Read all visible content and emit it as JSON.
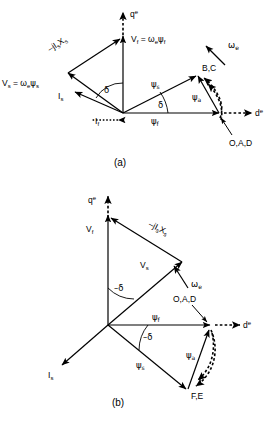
{
  "figure": {
    "type": "phasor-vector-diagram",
    "background_color": "#ffffff",
    "line_color": "#000000",
    "panels": [
      {
        "id": "a",
        "caption": "(a)",
        "description": "Phasor diagram for motoring operation with positive load angle delta",
        "axes": [
          {
            "name": "q-axis",
            "label": "q",
            "superscript": "e",
            "style": "dashed-arrow",
            "direction": "up"
          },
          {
            "name": "d-axis",
            "label": "d",
            "superscript": "e",
            "style": "dashed-arrow",
            "direction": "right"
          }
        ],
        "vectors": [
          {
            "name": "stator-voltage",
            "label": "V",
            "subscript": "s",
            "expression": "Vₛ = ωₑψₛ"
          },
          {
            "name": "field-voltage",
            "label": "V",
            "subscript": "f",
            "expression": "V_f = ωₑψ_f"
          },
          {
            "name": "reactance-drop",
            "label": "-jIₛXₛ"
          },
          {
            "name": "stator-current",
            "label": "I",
            "subscript": "s"
          },
          {
            "name": "field-current",
            "label": "I",
            "subscript": "f"
          },
          {
            "name": "stator-flux",
            "label": "ψ",
            "subscript": "s"
          },
          {
            "name": "field-flux",
            "label": "ψ",
            "subscript": "f"
          },
          {
            "name": "armature-flux",
            "label": "ψ",
            "subscript": "a"
          },
          {
            "name": "sync-speed",
            "label": "ω",
            "subscript": "e"
          }
        ],
        "angles": [
          {
            "name": "delta-upper",
            "label": "δ"
          },
          {
            "name": "delta-lower",
            "label": "δ"
          }
        ],
        "point_labels": [
          {
            "name": "point-bc",
            "label": "B,C"
          },
          {
            "name": "point-oad",
            "label": "O,A,D"
          }
        ]
      },
      {
        "id": "b",
        "caption": "(b)",
        "description": "Phasor diagram for generating operation with negative load angle delta",
        "axes": [
          {
            "name": "q-axis",
            "label": "q",
            "superscript": "e",
            "style": "dashed-arrow",
            "direction": "up"
          },
          {
            "name": "d-axis",
            "label": "d",
            "superscript": "e",
            "style": "dashed-arrow",
            "direction": "right"
          }
        ],
        "vectors": [
          {
            "name": "stator-voltage",
            "label": "V",
            "subscript": "s"
          },
          {
            "name": "field-voltage",
            "label": "V",
            "subscript": "f"
          },
          {
            "name": "reactance-drop",
            "label": "-jIₛXₛ"
          },
          {
            "name": "stator-current",
            "label": "I",
            "subscript": "s"
          },
          {
            "name": "stator-flux",
            "label": "ψ",
            "subscript": "s"
          },
          {
            "name": "field-flux",
            "label": "ψ",
            "subscript": "f"
          },
          {
            "name": "armature-flux",
            "label": "ψ",
            "subscript": "a"
          },
          {
            "name": "sync-speed",
            "label": "ω",
            "subscript": "e"
          }
        ],
        "angles": [
          {
            "name": "neg-delta-upper",
            "label": "−δ"
          },
          {
            "name": "neg-delta-lower",
            "label": "−δ"
          }
        ],
        "point_labels": [
          {
            "name": "point-oad",
            "label": "O,A,D"
          },
          {
            "name": "point-fe",
            "label": "F,E"
          }
        ]
      }
    ]
  },
  "labels": {
    "panel_a": {
      "q_axis": "q",
      "q_axis_sup": "e",
      "d_axis": "d",
      "d_axis_sup": "e",
      "vf_eq": "V",
      "vf_sub": "f",
      "vf_rest": " = ω",
      "vf_rest_sub": "e",
      "vf_psi": "ψ",
      "vf_psi_sub": "f",
      "vs_eq": "V",
      "vs_sub": "s",
      "vs_rest": " = ω",
      "vs_rest_sub": "e",
      "vs_psi": "ψ",
      "vs_psi_sub": "s",
      "jisxs": "–jI",
      "jisxs_sub1": "s",
      "jisxs_x": "X",
      "jisxs_sub2": "s",
      "is": "I",
      "is_sub": "s",
      "if": "I",
      "if_sub": "f",
      "psi_s": "ψ",
      "psi_s_sub": "s",
      "psi_f": "ψ",
      "psi_f_sub": "f",
      "psi_a": "ψ",
      "psi_a_sub": "a",
      "omega_e": "ω",
      "omega_e_sub": "e",
      "delta_1": "δ",
      "delta_2": "δ",
      "bc": "B,C",
      "oad": "O,A,D",
      "caption": "(a)"
    },
    "panel_b": {
      "q_axis": "q",
      "q_axis_sup": "e",
      "d_axis": "d",
      "d_axis_sup": "e",
      "vf": "V",
      "vf_sub": "f",
      "vs": "V",
      "vs_sub": "s",
      "jisxs": "–jI",
      "jisxs_sub1": "s",
      "jisxs_x": "X",
      "jisxs_sub2": "s",
      "is": "I",
      "is_sub": "s",
      "psi_s": "ψ",
      "psi_s_sub": "s",
      "psi_f": "ψ",
      "psi_f_sub": "f",
      "psi_a": "ψ",
      "psi_a_sub": "a",
      "omega_e": "ω",
      "omega_e_sub": "e",
      "delta_1": "–δ",
      "delta_2": "–δ",
      "oad": "O,A,D",
      "fe": "F,E",
      "caption": "(b)"
    }
  }
}
